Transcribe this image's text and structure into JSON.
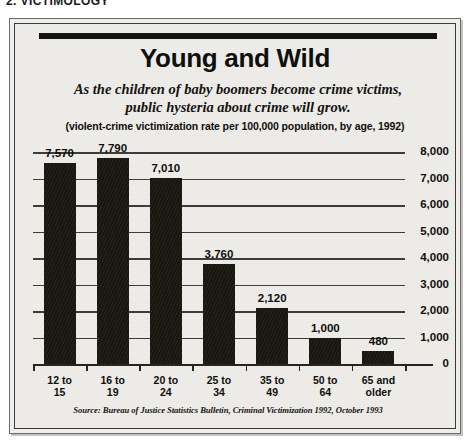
{
  "page_header": "2. VICTIMOLOGY",
  "figure": {
    "title": "Young and Wild",
    "subtitle": "As the children of baby boomers become crime victims, public hysteria about crime will grow.",
    "units_note": "(violent-crime victimization rate per 100,000 population, by age, 1992)",
    "source": "Source: Bureau of Justice Statistics Bulletin, Criminal Victimization 1992, October 1993"
  },
  "chart_data": {
    "type": "bar",
    "title": "Young and Wild",
    "subtitle": "As the children of baby boomers become crime victims, public hysteria about crime will grow.",
    "xlabel": "",
    "ylabel": "(violent-crime victimization rate per 100,000 population, by age, 1992)",
    "categories": [
      "12 to 15",
      "16 to 19",
      "20 to 24",
      "25 to 34",
      "35 to 49",
      "50 to 64",
      "65 and older"
    ],
    "category_lines": [
      [
        "12 to",
        "15"
      ],
      [
        "16 to",
        "19"
      ],
      [
        "20 to",
        "24"
      ],
      [
        "25 to",
        "34"
      ],
      [
        "35 to",
        "49"
      ],
      [
        "50 to",
        "64"
      ],
      [
        "65 and",
        "older"
      ]
    ],
    "values": [
      7570,
      7790,
      7010,
      3760,
      2120,
      1000,
      480
    ],
    "value_labels": [
      "7,570",
      "7,790",
      "7,010",
      "3,760",
      "2,120",
      "1,000",
      "480"
    ],
    "ylim": [
      0,
      8000
    ],
    "yticks": [
      0,
      1000,
      2000,
      3000,
      4000,
      5000,
      6000,
      7000,
      8000
    ],
    "ytick_labels": [
      "0",
      "1,000",
      "2,000",
      "3,000",
      "4,000",
      "5,000",
      "6,000",
      "7,000",
      "8,000"
    ],
    "grid": true,
    "legend": "none",
    "bar_color": "#17160f",
    "axis_color": "#26251f",
    "background_color": "#eeede9",
    "source": "Source: Bureau of Justice Statistics Bulletin, Criminal Victimization 1992, October 1993"
  }
}
